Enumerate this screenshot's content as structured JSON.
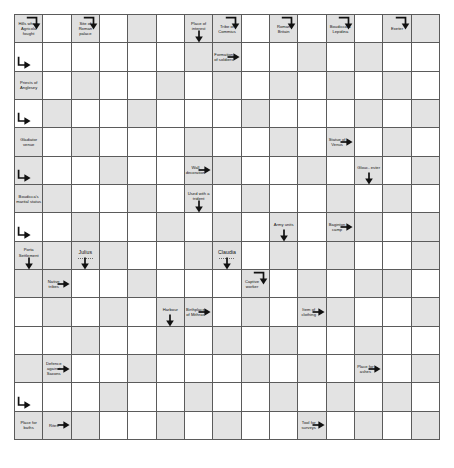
{
  "puzzle": {
    "type": "arrowword-crossword",
    "columns": 15,
    "rows": 15,
    "cell_size_px": 28.4,
    "colors": {
      "grid_line": "#5b5b5b",
      "clue_cell_bg": "#e0e0e0",
      "shaded_cell_bg": "#e3e3e3",
      "empty_cell_bg": "#ffffff",
      "text": "#111111",
      "arrow": "#111111"
    }
  },
  "clues": [
    {
      "id": "hills-where-agricola-fought",
      "text": "Hills where Agricola fought",
      "col": 0,
      "row": 0,
      "arrow": "hook-down",
      "size": "small"
    },
    {
      "id": "site-of-roman-palace",
      "text": "Site of Roman palace",
      "col": 2,
      "row": 0,
      "arrow": "hook-down",
      "size": "small"
    },
    {
      "id": "place-of-interest",
      "text": "Place of interest",
      "col": 6,
      "row": 0,
      "arrow": "down-edge",
      "size": "small"
    },
    {
      "id": "tribe-of-commius",
      "text": "Tribe of Commius",
      "col": 7,
      "row": 0,
      "arrow": "hook-down",
      "size": "small"
    },
    {
      "id": "roman-britain",
      "text": "Roman Britain",
      "col": 9,
      "row": 0,
      "arrow": "hook-down",
      "size": "small"
    },
    {
      "id": "boudicca-and-lepidina",
      "text": "Boudicca & Lepidina",
      "col": 11,
      "row": 0,
      "arrow": "hook-down",
      "size": "small"
    },
    {
      "id": "exeter",
      "text": "Exeter",
      "col": 13,
      "row": 0,
      "arrow": "hook-down",
      "size": "small"
    },
    {
      "id": "formation-of-soldiers",
      "text": "Formation of soldiers",
      "col": 7,
      "row": 1,
      "arrow": "right",
      "size": "small"
    },
    {
      "id": "priests-of-anglesey",
      "text": "Priests of Anglesey",
      "col": 0,
      "row": 2,
      "arrow": "hook-right-above",
      "size": "small"
    },
    {
      "id": "gladiator-venue",
      "text": "Gladiator venue",
      "col": 0,
      "row": 4,
      "arrow": "hook-right-above",
      "size": "small"
    },
    {
      "id": "statue-of-venus",
      "text": "Statue of Venus",
      "col": 11,
      "row": 4,
      "arrow": "right",
      "size": "small"
    },
    {
      "id": "wall-decoration",
      "text": "Wall decoration",
      "col": 6,
      "row": 5,
      "arrow": "right",
      "size": "small"
    },
    {
      "id": "gloucester",
      "text": "Glouc- ester",
      "col": 12,
      "row": 5,
      "arrow": "down-edge",
      "size": "small"
    },
    {
      "id": "boudiccas-marital-status",
      "text": "Boudicca's marital status",
      "col": 0,
      "row": 6,
      "arrow": "hook-right-above",
      "size": "small"
    },
    {
      "id": "used-with-a-trident",
      "text": "Used with a trident",
      "col": 6,
      "row": 6,
      "arrow": "down-edge",
      "size": "small"
    },
    {
      "id": "army-units",
      "text": "Army units",
      "col": 9,
      "row": 7,
      "arrow": "down-edge",
      "size": "small"
    },
    {
      "id": "baginton-camp",
      "text": "Baginton camp",
      "col": 11,
      "row": 7,
      "arrow": "right",
      "size": "small"
    },
    {
      "id": "porta-settlement",
      "text": "Porta Settlement",
      "col": 0,
      "row": 8,
      "arrow": "hook-right-above-and-down-edge",
      "size": "small"
    },
    {
      "id": "julius",
      "text": "Julius",
      "col": 2,
      "row": 8,
      "arrow": "down-edge",
      "size": "named"
    },
    {
      "id": "claudia",
      "text": "Claudia",
      "col": 7,
      "row": 8,
      "arrow": "down-edge",
      "size": "named"
    },
    {
      "id": "captive-worker",
      "text": "Captive worker",
      "col": 8,
      "row": 9,
      "arrow": "hook-down-above",
      "size": "small"
    },
    {
      "id": "native-tribes",
      "text": "Native tribes",
      "col": 1,
      "row": 9,
      "arrow": "right",
      "size": "small"
    },
    {
      "id": "birthplace-of-mithras",
      "text": "Birthplace of Mithras",
      "col": 6,
      "row": 10,
      "arrow": "right",
      "size": "small"
    },
    {
      "id": "harbour",
      "text": "Harbour",
      "col": 5,
      "row": 10,
      "arrow": "down-edge",
      "size": "small"
    },
    {
      "id": "item-of-clothing",
      "text": "Item of clothing",
      "col": 10,
      "row": 10,
      "arrow": "right",
      "size": "small"
    },
    {
      "id": "defence-against-saxons",
      "text": "Defence against Saxons",
      "col": 1,
      "row": 12,
      "arrow": "right",
      "size": "small"
    },
    {
      "id": "place-for-ashes",
      "text": "Place for ashes",
      "col": 12,
      "row": 12,
      "arrow": "right",
      "size": "small"
    },
    {
      "id": "place-for-baths",
      "text": "Place for baths",
      "col": 0,
      "row": 14,
      "arrow": "hook-right-above",
      "size": "small"
    },
    {
      "id": "rites",
      "text": "Rites",
      "col": 1,
      "row": 14,
      "arrow": "right",
      "size": "small"
    },
    {
      "id": "tool-for-surveys",
      "text": "Tool for surveys",
      "col": 10,
      "row": 14,
      "arrow": "right",
      "size": "small"
    }
  ],
  "shaded_cells": [
    [
      4,
      0
    ],
    [
      14,
      0
    ],
    [
      6,
      1
    ],
    [
      10,
      1
    ],
    [
      12,
      1
    ],
    [
      2,
      2
    ],
    [
      5,
      2
    ],
    [
      7,
      2
    ],
    [
      9,
      2
    ],
    [
      11,
      2
    ],
    [
      13,
      2
    ],
    [
      1,
      3
    ],
    [
      4,
      3
    ],
    [
      8,
      3
    ],
    [
      12,
      3
    ],
    [
      14,
      3
    ],
    [
      2,
      4
    ],
    [
      6,
      4
    ],
    [
      9,
      4
    ],
    [
      13,
      4
    ],
    [
      0,
      5
    ],
    [
      3,
      5
    ],
    [
      7,
      5
    ],
    [
      10,
      5
    ],
    [
      14,
      5
    ],
    [
      1,
      6
    ],
    [
      4,
      6
    ],
    [
      8,
      6
    ],
    [
      11,
      6
    ],
    [
      13,
      6
    ],
    [
      2,
      7
    ],
    [
      5,
      7
    ],
    [
      7,
      7
    ],
    [
      12,
      7
    ],
    [
      14,
      7
    ],
    [
      1,
      8
    ],
    [
      3,
      8
    ],
    [
      6,
      8
    ],
    [
      9,
      8
    ],
    [
      11,
      8
    ],
    [
      14,
      8
    ],
    [
      0,
      9
    ],
    [
      4,
      9
    ],
    [
      10,
      9
    ],
    [
      12,
      9
    ],
    [
      13,
      9
    ],
    [
      1,
      10
    ],
    [
      3,
      10
    ],
    [
      8,
      10
    ],
    [
      11,
      10
    ],
    [
      14,
      10
    ],
    [
      2,
      11
    ],
    [
      5,
      11
    ],
    [
      7,
      11
    ],
    [
      9,
      11
    ],
    [
      12,
      11
    ],
    [
      0,
      12
    ],
    [
      4,
      12
    ],
    [
      8,
      12
    ],
    [
      10,
      12
    ],
    [
      14,
      12
    ],
    [
      3,
      13
    ],
    [
      6,
      13
    ],
    [
      9,
      13
    ],
    [
      11,
      13
    ],
    [
      13,
      13
    ],
    [
      2,
      14
    ],
    [
      5,
      14
    ],
    [
      7,
      14
    ],
    [
      12,
      14
    ],
    [
      14,
      14
    ]
  ]
}
